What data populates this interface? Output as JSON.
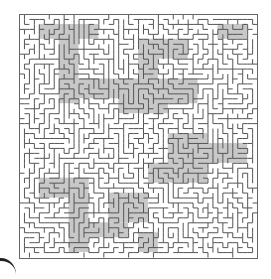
{
  "puzzle": {
    "type": "maze",
    "title_visible": false,
    "grid": {
      "cols": 48,
      "rows": 49,
      "cell_px": 4.96
    },
    "origin": {
      "x": 19,
      "y": 14
    },
    "size": {
      "width": 238,
      "height": 244
    },
    "seed": 90731,
    "colors": {
      "background": "#ffffff",
      "wall": "#555555",
      "border": "#666666",
      "shade": "#c8c8c8"
    },
    "shaded_regions": [
      {
        "x": 4,
        "y": 2,
        "w": 12,
        "h": 3
      },
      {
        "x": 8,
        "y": 4,
        "w": 4,
        "h": 14
      },
      {
        "x": 10,
        "y": 13,
        "w": 14,
        "h": 4
      },
      {
        "x": 20,
        "y": 16,
        "w": 10,
        "h": 4
      },
      {
        "x": 24,
        "y": 5,
        "w": 10,
        "h": 4
      },
      {
        "x": 24,
        "y": 8,
        "w": 4,
        "h": 12
      },
      {
        "x": 28,
        "y": 13,
        "w": 8,
        "h": 5
      },
      {
        "x": 4,
        "y": 33,
        "w": 10,
        "h": 4
      },
      {
        "x": 10,
        "y": 33,
        "w": 4,
        "h": 15
      },
      {
        "x": 12,
        "y": 42,
        "w": 10,
        "h": 3
      },
      {
        "x": 18,
        "y": 36,
        "w": 8,
        "h": 6
      },
      {
        "x": 26,
        "y": 30,
        "w": 12,
        "h": 4
      },
      {
        "x": 30,
        "y": 24,
        "w": 8,
        "h": 7
      },
      {
        "x": 24,
        "y": 44,
        "w": 4,
        "h": 4
      },
      {
        "x": 36,
        "y": 26,
        "w": 10,
        "h": 4
      },
      {
        "x": 40,
        "y": 2,
        "w": 6,
        "h": 3
      }
    ]
  }
}
